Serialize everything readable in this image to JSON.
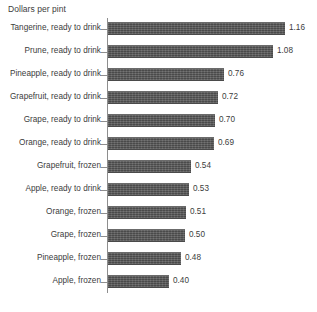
{
  "chart_data": {
    "type": "bar",
    "title": "Dollars per pint",
    "orientation": "horizontal",
    "xlabel": "",
    "ylabel": "",
    "grid": false,
    "legend": "none",
    "xlim": [
      0,
      1.25
    ],
    "value_format": "0.00",
    "categories": [
      "Tangerine, ready to drink",
      "Prune, ready to drink",
      "Pineapple, ready to drink",
      "Grapefruit, ready to drink",
      "Grape, ready to drink",
      "Orange, ready to drink",
      "Grapefruit, frozen",
      "Apple, ready to drink",
      "Orange, frozen",
      "Grape, frozen",
      "Pineapple, frozen",
      "Apple, frozen"
    ],
    "values": [
      1.16,
      1.08,
      0.76,
      0.72,
      0.7,
      0.69,
      0.54,
      0.53,
      0.51,
      0.5,
      0.48,
      0.4
    ],
    "value_labels": [
      "1.16",
      "1.08",
      "0.76",
      "0.72",
      "0.70",
      "0.69",
      "0.54",
      "0.53",
      "0.51",
      "0.50",
      "0.48",
      "0.40"
    ],
    "bar_color": "#585858",
    "text_color": "#3c3c3c",
    "axis_color": "#8e8e8e",
    "background_color": "#ffffff"
  }
}
